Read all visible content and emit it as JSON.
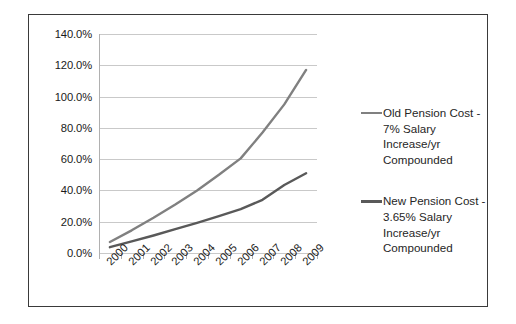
{
  "chart_data": {
    "type": "line",
    "title": "",
    "xlabel": "",
    "ylabel": "",
    "x": [
      "2000",
      "2001",
      "2002",
      "2003",
      "2004",
      "2005",
      "2006",
      "2007",
      "2008",
      "2009"
    ],
    "categories": [
      "2000",
      "2001",
      "2002",
      "2003",
      "2004",
      "2005",
      "2006",
      "2007",
      "2008",
      "2009"
    ],
    "ylim": [
      0,
      140
    ],
    "ytick_labels": [
      "0.0%",
      "20.0%",
      "40.0%",
      "60.0%",
      "80.0%",
      "100.0%",
      "120.0%",
      "140.0%"
    ],
    "ytick_values": [
      0,
      20,
      40,
      60,
      80,
      100,
      120,
      140
    ],
    "grid": true,
    "legend_position": "right",
    "series": [
      {
        "name": "Old Pension Cost - 7% Salary Increase/yr Compounded",
        "color": "#808080",
        "values": [
          7.0,
          14.5,
          22.5,
          31.0,
          40.0,
          50.0,
          60.5,
          77.0,
          95.0,
          117.0
        ]
      },
      {
        "name": "New Pension Cost - 3.65% Salary Increase/yr Compounded",
        "color": "#595959",
        "values": [
          3.7,
          7.4,
          11.2,
          15.2,
          19.3,
          23.6,
          28.0,
          34.0,
          43.5,
          51.0
        ]
      }
    ]
  },
  "legend": {
    "entries": [
      {
        "label": "Old Pension Cost - 7% Salary Increase/yr Compounded",
        "color": "#808080"
      },
      {
        "label": "New Pension Cost - 3.65% Salary Increase/yr Compounded",
        "color": "#595959"
      }
    ]
  }
}
